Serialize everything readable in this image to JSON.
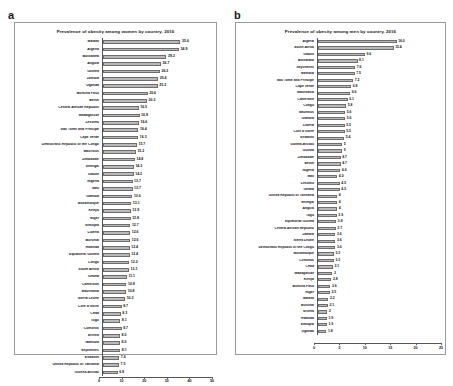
{
  "figure": {
    "panels": [
      {
        "letter": "a",
        "chart_data": {
          "type": "bar",
          "orientation": "horizontal",
          "title": "Prevalence of obesity among women by country, 2016",
          "xlabel": "",
          "ylabel": "",
          "xlim": [
            0,
            50
          ],
          "xticks": [
            "0",
            "10",
            "20",
            "30",
            "40",
            "50"
          ],
          "grid": false,
          "legend": "none",
          "categories": [
            "Malawi",
            "Algeria",
            "Botswana",
            "Angola",
            "Guinea",
            "Zambia",
            "Uganda",
            "Burkina Faso",
            "Benin",
            "Central African Republic",
            "Madagascar",
            "Lesotho",
            "Sao Tome and Principe",
            "Cape Verde",
            "Democratic Republic of the Congo",
            "Mauritius",
            "Zimbabwe",
            "Senegal",
            "Gabon",
            "Nigeria",
            "Mali",
            "Gambia",
            "Mozambique",
            "Kenya",
            "Niger",
            "Ethiopia",
            "Liberia",
            "Burundi",
            "Rwanda",
            "Equatorial Guinea",
            "Congo",
            "South Africa",
            "Ghana",
            "Cameroon",
            "Mauritania",
            "Sierra Leone",
            "Cote d'Ivoire",
            "Chad",
            "Togo",
            "Comoros",
            "Eritrea",
            "Namibia",
            "Seychelles",
            "Eswatini",
            "United Republic of Tanzania",
            "Guinea-Bissau"
          ],
          "values": [
            35.6,
            34.9,
            29.2,
            26.7,
            26.2,
            25.4,
            25.2,
            20.6,
            20.3,
            16.5,
            16.9,
            16.6,
            16.4,
            16.3,
            15.7,
            15.2,
            14.8,
            14.3,
            14.2,
            13.7,
            13.7,
            13.6,
            13.1,
            12.9,
            12.8,
            12.7,
            12.6,
            12.6,
            12.4,
            12.4,
            12.2,
            12.1,
            11.1,
            10.9,
            10.8,
            10.3,
            8.7,
            8.3,
            8.1,
            8.7,
            8.0,
            8.0,
            8.1,
            7.6,
            7.5,
            6.9
          ],
          "value_labels": [
            "35.6",
            "34.9",
            "29.2",
            "26.7",
            "26.2",
            "25.4",
            "25.2",
            "20.6",
            "20.3",
            "16.5",
            "16.9",
            "16.6",
            "16.4",
            "16.3",
            "15.7",
            "15.2",
            "14.8",
            "14.3",
            "14.2",
            "13.7",
            "13.7",
            "13.6",
            "13.1",
            "12.9",
            "12.8",
            "12.7",
            "12.6",
            "12.6",
            "12.4",
            "12.4",
            "12.2",
            "12.1",
            "11.1",
            "10.9",
            "10.8",
            "10.3",
            "8.7",
            "8.3",
            "8.1",
            "8.7",
            "8.0",
            "8.0",
            "8.1",
            "7.6",
            "7.5",
            "6.9"
          ]
        }
      },
      {
        "letter": "b",
        "chart_data": {
          "type": "bar",
          "orientation": "horizontal",
          "title": "Prevalence of obesity among men by country, 2016",
          "xlabel": "",
          "ylabel": "",
          "xlim": [
            0,
            25
          ],
          "xticks": [
            "0",
            "5",
            "10",
            "15",
            "20",
            "25"
          ],
          "grid": false,
          "legend": "none",
          "categories": [
            "Algeria",
            "South Africa",
            "Gabon",
            "Botswana",
            "Seychelles",
            "Namibia",
            "Sao Tome and Principe",
            "Cape Verde",
            "Mauritania",
            "Cameroon",
            "Congo",
            "Mauritius",
            "Gambia",
            "Liberia",
            "Cote d'Ivoire",
            "Eswatini",
            "Guinea-Bissau",
            "Guinea",
            "Zimbabwe",
            "Benin",
            "Nigeria",
            "Mali",
            "Lesotho",
            "Ghana",
            "United Republic of Tanzania",
            "Senegal",
            "Angola",
            "Togo",
            "Equatorial Guinea",
            "Central African Republic",
            "Zambia",
            "Sierra Leone",
            "Democratic Republic of the Congo",
            "Mozambique",
            "Comoros",
            "Chad",
            "Madagascar",
            "Kenya",
            "Burkina Faso",
            "Niger",
            "Malawi",
            "Burundi",
            "Eritrea",
            "Rwanda",
            "Ethiopia",
            "Uganda"
          ],
          "values": [
            16.0,
            15.4,
            9.6,
            8.1,
            7.6,
            7.5,
            7.2,
            6.8,
            6.6,
            6.1,
            5.8,
            5.6,
            5.6,
            5.5,
            5.5,
            5.4,
            5.0,
            5.0,
            4.7,
            4.7,
            4.6,
            4.0,
            4.5,
            4.5,
            4.0,
            4.0,
            4.0,
            3.9,
            3.8,
            3.7,
            3.6,
            3.6,
            3.6,
            3.3,
            3.3,
            3.1,
            3.0,
            2.8,
            2.6,
            2.5,
            2.2,
            2.1,
            2.0,
            1.9,
            1.9,
            1.8
          ],
          "value_labels": [
            "16.0",
            "15.4",
            "9.6",
            "8.1",
            "7.6",
            "7.5",
            "7.2",
            "6.8",
            "6.6",
            "6.1",
            "5.8",
            "5.6",
            "5.6",
            "5.5",
            "5.5",
            "5.4",
            "5",
            "5",
            "4.7",
            "4.7",
            "4.6",
            "4.0",
            "4.5",
            "4.5",
            "4",
            "4",
            "4",
            "3.9",
            "3.8",
            "3.7",
            "3.6",
            "3.6",
            "3.6",
            "3.3",
            "3.3",
            "3.1",
            "3",
            "2.8",
            "2.6",
            "2.5",
            "2.2",
            "2.1",
            "2",
            "1.9",
            "1.9",
            "1.8"
          ]
        }
      }
    ]
  }
}
